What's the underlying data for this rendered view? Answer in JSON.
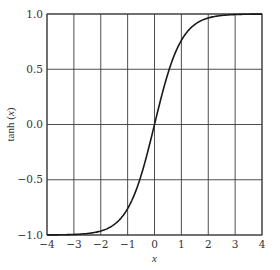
{
  "chart_data": {
    "type": "line",
    "title": "",
    "xlabel": "x",
    "ylabel": "tanh (x)",
    "xlim": [
      -4,
      4
    ],
    "ylim": [
      -1.0,
      1.0
    ],
    "grid": true,
    "legend": null,
    "x_ticks": [
      -4,
      -3,
      -2,
      -1,
      0,
      1,
      2,
      3,
      4
    ],
    "x_tick_labels": [
      "−4",
      "−3",
      "−2",
      "−1",
      "0",
      "1",
      "2",
      "3",
      "4"
    ],
    "y_ticks": [
      -1.0,
      -0.5,
      0.0,
      0.5,
      1.0
    ],
    "y_tick_labels": [
      "−1.0",
      "−0.5",
      "0.0",
      "0.5",
      "1.0"
    ],
    "series": [
      {
        "name": "tanh(x)",
        "color": "#1a1a1a",
        "x": [
          -4,
          -3.5,
          -3,
          -2.5,
          -2,
          -1.5,
          -1,
          -0.5,
          0,
          0.5,
          1,
          1.5,
          2,
          2.5,
          3,
          3.5,
          4
        ],
        "y": [
          -0.999,
          -0.998,
          -0.995,
          -0.987,
          -0.964,
          -0.905,
          -0.762,
          -0.462,
          0.0,
          0.462,
          0.762,
          0.905,
          0.964,
          0.987,
          0.995,
          0.998,
          0.999
        ]
      }
    ]
  },
  "colors": {
    "grid": "#3a3a3a",
    "curve": "#1a1a1a",
    "text": "#333333",
    "background": "#ffffff"
  }
}
